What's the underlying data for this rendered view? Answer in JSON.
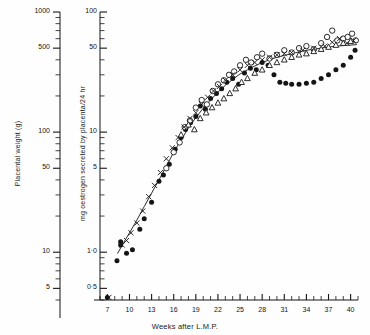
{
  "figure": {
    "background": "#fefefe",
    "ink": "#151515"
  },
  "axes": {
    "x": {
      "label": "Weeks after L.M.P.",
      "min": 6,
      "max": 41,
      "tick_step": 1,
      "labeled_ticks": [
        7,
        10,
        13,
        16,
        19,
        22,
        25,
        28,
        31,
        34,
        37,
        40
      ],
      "tick_labels": [
        "7",
        "10",
        "13",
        "16",
        "19",
        "22",
        "25",
        "28",
        "31",
        "34",
        "37",
        "40"
      ]
    },
    "y_main": {
      "label": "mg oestrogen secreted by placenta/24 hr",
      "scale": "log",
      "min": 0.4,
      "max": 100,
      "labeled_ticks": [
        100,
        50,
        10,
        5,
        1.0,
        0.5
      ],
      "tick_labels": [
        "100",
        "50",
        "10",
        "5",
        "1·0",
        "0·5"
      ]
    },
    "y_left": {
      "label": "Placental weight (g)",
      "scale": "log",
      "min": 4,
      "max": 1000,
      "labeled_ticks": [
        1000,
        500,
        100,
        50,
        10,
        5
      ],
      "tick_labels": [
        "1000",
        "500",
        "100",
        "50",
        "10",
        "5"
      ]
    }
  },
  "chart_data": {
    "type": "scatter",
    "title": "",
    "xlabel": "Weeks after L.M.P.",
    "ylabel": "mg oestrogen secreted by placenta/24 hr",
    "ylabel_secondary": "Placental weight (g)",
    "xlim": [
      6,
      41
    ],
    "ylim": [
      0.4,
      100
    ],
    "yscale": "log",
    "grid": false,
    "legend": "none",
    "series": [
      {
        "name": "filled-circle",
        "marker": "filled-circle",
        "points": [
          [
            7.0,
            0.42
          ],
          [
            8.3,
            0.85
          ],
          [
            8.8,
            1.22
          ],
          [
            8.8,
            1.15
          ],
          [
            9.6,
            0.98
          ],
          [
            10.4,
            1.05
          ],
          [
            11.4,
            1.55
          ],
          [
            12.0,
            1.9
          ],
          [
            13.0,
            2.6
          ],
          [
            14.0,
            3.9
          ],
          [
            14.6,
            4.4
          ],
          [
            15.4,
            5.4
          ],
          [
            16.2,
            7.2
          ],
          [
            17.0,
            9.0
          ],
          [
            17.6,
            10.5
          ],
          [
            18.3,
            12.0
          ],
          [
            19.0,
            13.5
          ],
          [
            19.6,
            16.5
          ],
          [
            20.3,
            15.5
          ],
          [
            21.0,
            19.0
          ],
          [
            21.8,
            21.0
          ],
          [
            22.5,
            23.0
          ],
          [
            23.2,
            26.0
          ],
          [
            24.0,
            28.0
          ],
          [
            24.8,
            25.0
          ],
          [
            25.6,
            31.0
          ],
          [
            26.4,
            34.0
          ],
          [
            27.2,
            33.0
          ],
          [
            28.0,
            38.0
          ],
          [
            28.8,
            36.0
          ],
          [
            29.6,
            30.0
          ],
          [
            30.4,
            26.0
          ],
          [
            31.2,
            25.5
          ],
          [
            32.0,
            25.0
          ],
          [
            33.0,
            25.0
          ],
          [
            34.0,
            25.5
          ],
          [
            35.0,
            26.0
          ],
          [
            36.0,
            28.0
          ],
          [
            37.0,
            30.0
          ],
          [
            38.0,
            33.0
          ],
          [
            39.0,
            36.0
          ],
          [
            40.0,
            42.0
          ],
          [
            40.6,
            48.0
          ]
        ]
      },
      {
        "name": "open-circle",
        "marker": "open-circle",
        "points": [
          [
            15.0,
            5.0
          ],
          [
            16.0,
            6.8
          ],
          [
            16.8,
            8.2
          ],
          [
            17.5,
            11.0
          ],
          [
            18.2,
            12.5
          ],
          [
            19.0,
            16.0
          ],
          [
            19.8,
            18.5
          ],
          [
            20.5,
            17.0
          ],
          [
            21.3,
            22.0
          ],
          [
            22.0,
            25.0
          ],
          [
            22.8,
            27.0
          ],
          [
            23.5,
            30.0
          ],
          [
            24.2,
            32.0
          ],
          [
            25.0,
            36.0
          ],
          [
            25.8,
            40.0
          ],
          [
            26.5,
            38.0
          ],
          [
            27.3,
            42.0
          ],
          [
            28.0,
            45.0
          ],
          [
            29.0,
            41.0
          ],
          [
            30.0,
            44.0
          ],
          [
            31.0,
            48.0
          ],
          [
            32.0,
            46.0
          ],
          [
            33.0,
            50.0
          ],
          [
            34.0,
            52.0
          ],
          [
            35.0,
            49.0
          ],
          [
            36.0,
            55.0
          ],
          [
            36.8,
            62.0
          ],
          [
            37.5,
            70.0
          ],
          [
            38.2,
            58.0
          ],
          [
            39.0,
            60.0
          ],
          [
            39.6,
            62.0
          ],
          [
            40.2,
            66.0
          ],
          [
            40.7,
            58.0
          ]
        ]
      },
      {
        "name": "cross",
        "marker": "cross",
        "points": [
          [
            7.2,
            0.42
          ],
          [
            9.0,
            1.15
          ],
          [
            9.6,
            1.25
          ],
          [
            10.2,
            1.45
          ],
          [
            11.0,
            1.75
          ],
          [
            11.8,
            2.2
          ],
          [
            12.6,
            2.9
          ],
          [
            13.4,
            3.6
          ],
          [
            14.2,
            4.6
          ],
          [
            15.0,
            6.0
          ],
          [
            15.8,
            7.4
          ],
          [
            16.6,
            9.0
          ],
          [
            17.4,
            11.0
          ],
          [
            18.2,
            13.0
          ],
          [
            19.0,
            14.5
          ],
          [
            19.8,
            17.0
          ],
          [
            20.6,
            19.5
          ],
          [
            21.4,
            22.0
          ],
          [
            22.2,
            24.0
          ],
          [
            23.0,
            27.0
          ],
          [
            24.0,
            30.0
          ],
          [
            25.0,
            33.0
          ],
          [
            26.0,
            36.0
          ],
          [
            27.0,
            38.0
          ],
          [
            28.0,
            40.0
          ],
          [
            29.0,
            42.0
          ],
          [
            30.0,
            44.0
          ],
          [
            31.0,
            45.0
          ],
          [
            32.0,
            46.0
          ],
          [
            33.5,
            48.0
          ],
          [
            35.0,
            50.0
          ],
          [
            36.5,
            52.0
          ],
          [
            37.5,
            56.0
          ],
          [
            38.5,
            60.0
          ],
          [
            39.5,
            55.0
          ],
          [
            40.4,
            58.0
          ]
        ]
      },
      {
        "name": "open-triangle",
        "marker": "open-triangle",
        "points": [
          [
            17.0,
            9.5
          ],
          [
            18.0,
            11.5
          ],
          [
            18.8,
            10.5
          ],
          [
            19.6,
            13.0
          ],
          [
            20.4,
            14.5
          ],
          [
            21.2,
            16.0
          ],
          [
            22.0,
            17.5
          ],
          [
            22.8,
            19.0
          ],
          [
            23.6,
            21.0
          ],
          [
            24.4,
            23.0
          ],
          [
            25.2,
            26.0
          ],
          [
            26.0,
            28.0
          ],
          [
            27.0,
            31.0
          ],
          [
            28.0,
            33.0
          ],
          [
            29.0,
            36.0
          ],
          [
            30.0,
            38.0
          ],
          [
            31.0,
            40.0
          ],
          [
            32.0,
            42.0
          ],
          [
            33.0,
            44.0
          ],
          [
            34.0,
            45.0
          ],
          [
            35.0,
            47.0
          ],
          [
            36.0,
            49.0
          ],
          [
            37.0,
            51.0
          ],
          [
            38.0,
            53.0
          ],
          [
            39.0,
            55.0
          ],
          [
            40.0,
            57.0
          ]
        ]
      }
    ],
    "fit_curve": {
      "name": "fitted-curve",
      "points": [
        [
          8.4,
          0.98
        ],
        [
          9.2,
          1.2
        ],
        [
          10.0,
          1.45
        ],
        [
          11.0,
          1.85
        ],
        [
          12.0,
          2.4
        ],
        [
          13.0,
          3.1
        ],
        [
          14.0,
          4.0
        ],
        [
          15.0,
          5.2
        ],
        [
          16.0,
          6.8
        ],
        [
          17.0,
          8.6
        ],
        [
          18.0,
          10.8
        ],
        [
          19.0,
          13.2
        ],
        [
          20.0,
          15.8
        ],
        [
          21.0,
          18.5
        ],
        [
          22.0,
          21.5
        ],
        [
          23.0,
          24.5
        ],
        [
          24.0,
          27.5
        ],
        [
          25.0,
          30.5
        ],
        [
          26.0,
          33.0
        ],
        [
          27.0,
          35.5
        ],
        [
          28.0,
          38.0
        ],
        [
          29.0,
          40.0
        ],
        [
          30.0,
          42.0
        ],
        [
          31.0,
          43.5
        ],
        [
          32.0,
          45.0
        ],
        [
          33.0,
          46.5
        ],
        [
          34.0,
          48.0
        ],
        [
          35.0,
          49.0
        ],
        [
          36.0,
          50.0
        ],
        [
          37.0,
          51.0
        ],
        [
          38.0,
          52.0
        ],
        [
          39.0,
          52.5
        ],
        [
          40.0,
          53.0
        ],
        [
          40.8,
          53.5
        ]
      ]
    }
  }
}
